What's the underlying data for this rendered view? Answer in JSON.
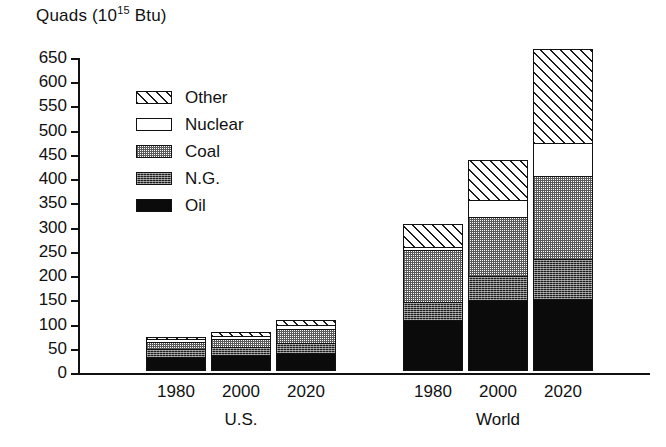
{
  "chart_data": {
    "type": "bar",
    "subtype": "stacked-bar",
    "title_parts": {
      "main": "Quads (10",
      "exponent": "15",
      "tail": " Btu)"
    },
    "xlabel": "",
    "ylabel": "",
    "ylim": [
      0,
      650
    ],
    "ytick_step": 50,
    "yticks": [
      "0",
      "50",
      "100",
      "150",
      "200",
      "250",
      "300",
      "350",
      "400",
      "450",
      "500",
      "550",
      "600",
      "650"
    ],
    "grid": false,
    "legend_position": "upper-left-inside",
    "categories": [
      "1980",
      "2000",
      "2020",
      "1980",
      "2000",
      "2020"
    ],
    "groups": [
      {
        "name": "U.S.",
        "categories": [
          "1980",
          "2000",
          "2020"
        ]
      },
      {
        "name": "World",
        "categories": [
          "1980",
          "2000",
          "2020"
        ]
      }
    ],
    "series": [
      {
        "name": "Oil",
        "pattern": "solid-black",
        "values": [
          33,
          38,
          40,
          124,
          146,
          148
        ]
      },
      {
        "name": "N.G.",
        "pattern": "dark-stipple",
        "values": [
          20,
          19,
          22,
          43,
          50,
          84
        ]
      },
      {
        "name": "Coal",
        "pattern": "light-stipple",
        "values": [
          17,
          20,
          32,
          126,
          121,
          170
        ]
      },
      {
        "name": "Nuclear",
        "pattern": "white",
        "values": [
          7,
          9,
          10,
          8,
          35,
          68
        ]
      },
      {
        "name": "Other",
        "pattern": "diagonal-hatch",
        "values": [
          5,
          8,
          10,
          54,
          83,
          195
        ]
      }
    ],
    "totals": [
      82,
      94,
      114,
      355,
      435,
      665
    ],
    "bar_totals_plotted": [
      70,
      80,
      105,
      303,
      435,
      665
    ]
  },
  "legend": {
    "items": [
      {
        "label": "Other",
        "swatch": "diagonal-hatch-swatch"
      },
      {
        "label": "Nuclear",
        "swatch": "white-swatch"
      },
      {
        "label": "Coal",
        "swatch": "light-stipple-swatch"
      },
      {
        "label": "N.G.",
        "swatch": "dark-stipple-swatch"
      },
      {
        "label": "Oil",
        "swatch": "solid-black-swatch"
      }
    ]
  },
  "axis": {
    "yticks": [
      {
        "value": 650,
        "label": "650"
      },
      {
        "value": 600,
        "label": "600"
      },
      {
        "value": 550,
        "label": "550"
      },
      {
        "value": 500,
        "label": "500"
      },
      {
        "value": 450,
        "label": "450"
      },
      {
        "value": 400,
        "label": "400"
      },
      {
        "value": 350,
        "label": "350"
      },
      {
        "value": 300,
        "label": "300"
      },
      {
        "value": 250,
        "label": "250"
      },
      {
        "value": 200,
        "label": "200"
      },
      {
        "value": 150,
        "label": "150"
      },
      {
        "value": 100,
        "label": "100"
      },
      {
        "value": 50,
        "label": "50"
      },
      {
        "value": 0,
        "label": "0"
      }
    ],
    "xticks": [
      {
        "label": "1980",
        "center": 98
      },
      {
        "label": "2000",
        "center": 163
      },
      {
        "label": "2020",
        "center": 228
      },
      {
        "label": "1980",
        "center": 355
      },
      {
        "label": "2000",
        "center": 420
      },
      {
        "label": "2020",
        "center": 485
      }
    ],
    "group_labels": [
      {
        "label": "U.S.",
        "center": 163
      },
      {
        "label": "World",
        "center": 420
      }
    ]
  },
  "colors": {
    "ink": "#111111",
    "paper": "#ffffff",
    "oil": "#0b0b0b",
    "ng": "#1c1c1c",
    "coal": "#5a5a5a",
    "nuclear": "#ffffff",
    "other": "#1a1a1a"
  }
}
